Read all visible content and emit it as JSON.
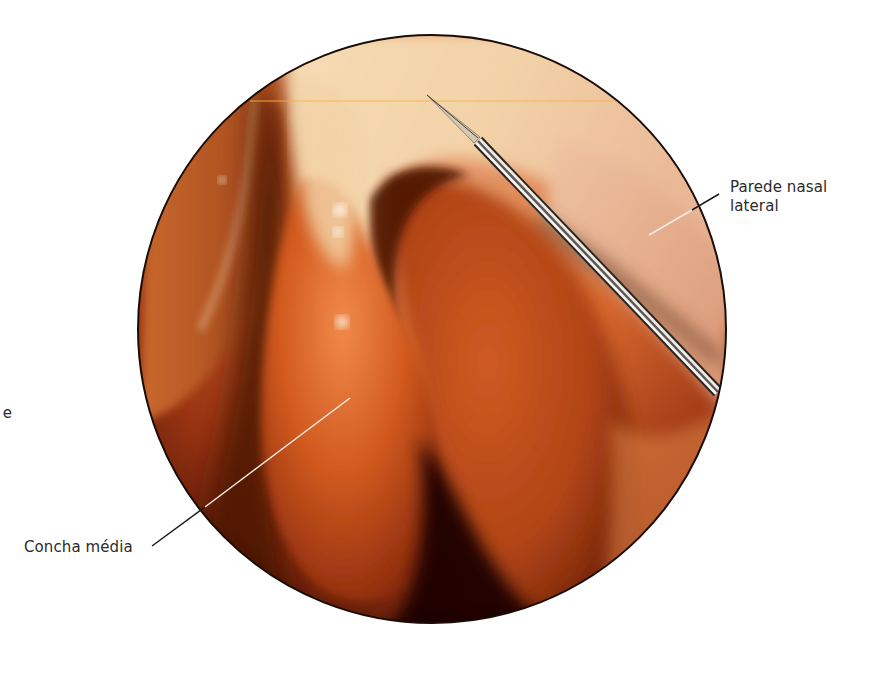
{
  "figure": {
    "type": "endoscopic-view",
    "view_circle": {
      "cx": 432,
      "cy": 329,
      "r": 294
    },
    "colors": {
      "background": "#ffffff",
      "border": "#1a0d08",
      "mucosa_light": "#f0c9a0",
      "mucosa_mid": "#d9632a",
      "mucosa_dark": "#5a1a08",
      "shadow": "#1a0603",
      "instrument": "#c8c6c2",
      "guide_line": "#f2b53a",
      "label_text": "#2b2b2b"
    }
  },
  "labels": {
    "parede_nasal_lateral": {
      "line1": "Parede nasal",
      "line2": "lateral"
    },
    "concha_media": "Concha média",
    "cut_off_fragment": "e"
  },
  "leaders": {
    "parede": {
      "x1": 649,
      "y1": 235,
      "x2": 719,
      "y2": 194
    },
    "concha": {
      "x1": 350,
      "y1": 398,
      "x2": 152,
      "y2": 546
    }
  },
  "instrument": {
    "tip": {
      "x": 427,
      "y": 95
    },
    "sheath_start": {
      "x": 476,
      "y": 140
    },
    "shaft_end": {
      "x": 718,
      "y": 392
    }
  }
}
